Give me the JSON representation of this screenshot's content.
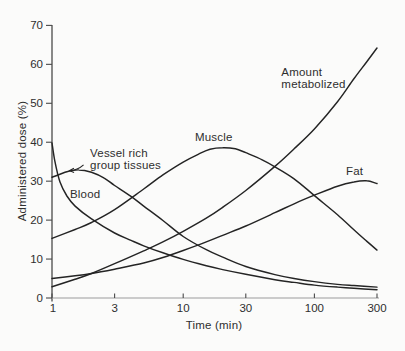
{
  "figure": {
    "type": "scanned-textbook-figure",
    "background": "#fbfbfa"
  },
  "chart_data": {
    "type": "line",
    "x_scale": "log",
    "title": "",
    "xlabel": "Time (min)",
    "ylabel": "Administered dose (%)",
    "xlim": [
      1,
      300
    ],
    "ylim": [
      0,
      70
    ],
    "x_ticks": [
      1,
      3,
      10,
      30,
      100,
      300
    ],
    "y_ticks": [
      0,
      10,
      20,
      30,
      40,
      50,
      60,
      70
    ],
    "grid": false,
    "legend": "inline-annotations",
    "line_color": "#242424",
    "axis_color": "#4a4a4a",
    "baseline_color": "#9b9b9b",
    "text_color": "#2e2e2e",
    "series": [
      {
        "id": "blood",
        "name": "Blood",
        "points": [
          [
            1,
            39.8
          ],
          [
            1.05,
            35.2
          ],
          [
            1.15,
            29.8
          ],
          [
            1.3,
            26.2
          ],
          [
            1.5,
            23.6
          ],
          [
            2,
            20.3
          ],
          [
            3,
            16.7
          ],
          [
            4,
            14.8
          ],
          [
            5,
            13.4
          ],
          [
            7,
            11.6
          ],
          [
            10,
            9.9
          ],
          [
            15,
            8.3
          ],
          [
            20,
            7.3
          ],
          [
            30,
            6.1
          ],
          [
            50,
            4.7
          ],
          [
            70,
            4
          ],
          [
            100,
            3.3
          ],
          [
            150,
            2.8
          ],
          [
            200,
            2.5
          ],
          [
            300,
            2.1
          ]
        ]
      },
      {
        "id": "vessel-rich-group",
        "name": "Vessel rich group tissues",
        "points": [
          [
            1,
            31
          ],
          [
            1.3,
            32.4
          ],
          [
            1.6,
            32.9
          ],
          [
            2,
            32.3
          ],
          [
            2.5,
            30.8
          ],
          [
            3,
            28.9
          ],
          [
            4,
            26.1
          ],
          [
            5,
            23.6
          ],
          [
            7,
            19.9
          ],
          [
            10,
            15.8
          ],
          [
            15,
            12.4
          ],
          [
            20,
            10.5
          ],
          [
            30,
            8.1
          ],
          [
            50,
            6
          ],
          [
            70,
            5
          ],
          [
            100,
            4.2
          ],
          [
            150,
            3.5
          ],
          [
            200,
            3.2
          ],
          [
            300,
            2.8
          ]
        ]
      },
      {
        "id": "muscle",
        "name": "Muscle",
        "points": [
          [
            1,
            15.3
          ],
          [
            1.5,
            17.6
          ],
          [
            2,
            19.4
          ],
          [
            3,
            22.7
          ],
          [
            5,
            28
          ],
          [
            7,
            31.6
          ],
          [
            10,
            34.9
          ],
          [
            13,
            36.9
          ],
          [
            16,
            38.2
          ],
          [
            20,
            38.6
          ],
          [
            25,
            38.3
          ],
          [
            30,
            37.3
          ],
          [
            40,
            35.5
          ],
          [
            50,
            33.7
          ],
          [
            70,
            30.6
          ],
          [
            100,
            26.3
          ],
          [
            150,
            21.4
          ],
          [
            200,
            17.5
          ],
          [
            250,
            14.6
          ],
          [
            300,
            12.3
          ]
        ]
      },
      {
        "id": "fat",
        "name": "Fat",
        "points": [
          [
            1,
            5
          ],
          [
            1.5,
            5.7
          ],
          [
            2,
            6.3
          ],
          [
            3,
            7.4
          ],
          [
            5,
            9
          ],
          [
            7,
            10.4
          ],
          [
            10,
            12.2
          ],
          [
            15,
            14.4
          ],
          [
            20,
            16.1
          ],
          [
            30,
            18.5
          ],
          [
            50,
            21.9
          ],
          [
            70,
            24.2
          ],
          [
            100,
            26.4
          ],
          [
            150,
            28.7
          ],
          [
            200,
            29.8
          ],
          [
            250,
            30.1
          ],
          [
            300,
            29.4
          ]
        ]
      },
      {
        "id": "amount-metabolized",
        "name": "Amount metabolized",
        "points": [
          [
            1,
            2.9
          ],
          [
            1.5,
            4.8
          ],
          [
            2,
            6.3
          ],
          [
            3,
            8.8
          ],
          [
            5,
            12.1
          ],
          [
            7,
            14.4
          ],
          [
            10,
            17.1
          ],
          [
            15,
            20.5
          ],
          [
            20,
            23.3
          ],
          [
            30,
            27.6
          ],
          [
            50,
            33.8
          ],
          [
            70,
            38.3
          ],
          [
            100,
            43.4
          ],
          [
            150,
            50.4
          ],
          [
            200,
            56.3
          ],
          [
            250,
            60.6
          ],
          [
            300,
            64.2
          ]
        ]
      }
    ],
    "annotations": [
      {
        "id": "vessel-rich-group",
        "lines": [
          "Vessel rich",
          "group tissues"
        ],
        "t": 1.95,
        "v": 36.2,
        "arrow": {
          "from_t": 1.74,
          "from_v": 34.2,
          "to_t": 1.36,
          "to_v": 32.7
        }
      },
      {
        "id": "blood",
        "lines": [
          "Blood"
        ],
        "t": 1.37,
        "v": 25.7
      },
      {
        "id": "muscle",
        "lines": [
          "Muscle"
        ],
        "t": 12.3,
        "v": 40.3
      },
      {
        "id": "amount-metabolized",
        "lines": [
          "Amount",
          "metabolized"
        ],
        "t": 56,
        "v": 56.9
      },
      {
        "id": "fat",
        "lines": [
          "Fat"
        ],
        "t": 174,
        "v": 31.5
      }
    ]
  }
}
